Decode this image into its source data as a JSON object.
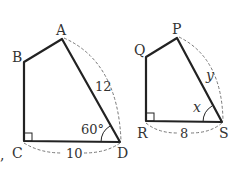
{
  "figures": [
    {
      "name": "quadrilateral-ABCD",
      "vertices": {
        "A": "A",
        "B": "B",
        "C": "C",
        "D": "D"
      },
      "side_AD": "12",
      "side_CD": "10",
      "angle_D": "60°",
      "right_angle_at": "C"
    },
    {
      "name": "quadrilateral-PQRS",
      "vertices": {
        "P": "P",
        "Q": "Q",
        "R": "R",
        "S": "S"
      },
      "side_PS": "y",
      "side_RS": "8",
      "angle_S": "x",
      "right_angle_at": "R"
    }
  ]
}
